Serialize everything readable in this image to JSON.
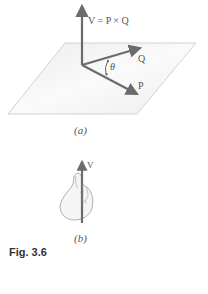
{
  "figure": {
    "caption": "Fig. 3.6",
    "panel_a": {
      "label": "(a)",
      "equation_label": "V = P × Q",
      "vector_q_label": "Q",
      "vector_p_label": "P",
      "angle_label": "θ"
    },
    "panel_b": {
      "label": "(b)",
      "vector_v_label": "V"
    },
    "colors": {
      "vector": "#6b6b6b",
      "plane_fill": "#f1f1f1",
      "plane_edge": "#c8c8c8",
      "text": "#555555"
    }
  }
}
